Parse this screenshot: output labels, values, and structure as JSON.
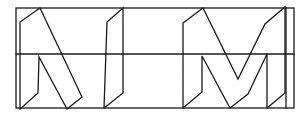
{
  "diagram": {
    "type": "line-drawing",
    "stroke_color": "#1a1a1a",
    "background": "#ffffff",
    "frame": {
      "outer_rect": {
        "x1": 16,
        "y1": 8,
        "x2": 294,
        "y2": 108
      },
      "inner_right_edge_x": 286,
      "midline_y": 54
    },
    "letters": [
      {
        "name": "N",
        "points": [
          [
            20,
            109
          ],
          [
            20,
            22
          ],
          [
            40,
            8
          ],
          [
            82,
            97
          ],
          [
            67,
            109
          ],
          [
            39,
            57
          ],
          [
            38,
            93
          ],
          [
            20,
            109
          ]
        ]
      },
      {
        "name": "I",
        "points": [
          [
            104,
            108
          ],
          [
            107,
            22
          ],
          [
            123,
            8
          ],
          [
            123,
            93
          ],
          [
            104,
            108
          ]
        ]
      },
      {
        "name": "M",
        "points": [
          [
            183,
            108
          ],
          [
            183,
            23
          ],
          [
            203,
            8
          ],
          [
            238,
            79
          ],
          [
            265,
            24
          ],
          [
            285,
            7
          ],
          [
            285,
            93
          ],
          [
            267,
            108
          ],
          [
            267,
            54
          ],
          [
            248,
            94
          ],
          [
            230,
            108
          ],
          [
            202,
            56
          ],
          [
            202,
            92
          ],
          [
            183,
            108
          ]
        ]
      }
    ]
  }
}
